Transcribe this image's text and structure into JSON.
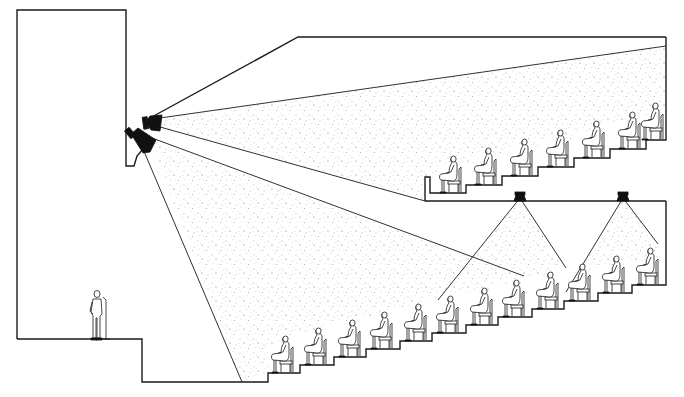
{
  "diagram": {
    "title": "",
    "colors": {
      "line": "#1a1a1a",
      "fill": "#111111",
      "background": "#ffffff",
      "coverage_dots": "#555555"
    },
    "elements": {
      "stage": {
        "label": "",
        "presenter": "person-at-microphone"
      },
      "proscenium_speakers": [
        {
          "name": "upper-horn",
          "aim": "balcony"
        },
        {
          "name": "lower-horn",
          "aim": "main-floor"
        }
      ],
      "under_balcony_speakers": [
        {
          "name": "delay-speaker-1"
        },
        {
          "name": "delay-speaker-2"
        }
      ],
      "main_floor_rows": 12,
      "balcony_rows": 7
    }
  }
}
